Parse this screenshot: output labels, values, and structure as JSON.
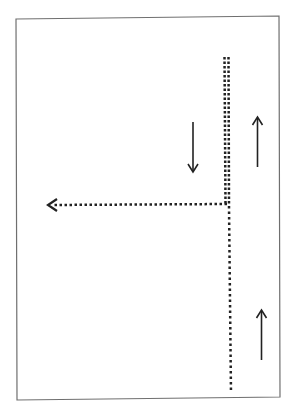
{
  "diagram": {
    "title": "",
    "colors": {
      "line": "#222222",
      "border": "#6f6f6f",
      "background": "#ffffff"
    },
    "elements": [
      {
        "id": "double-dotted-line",
        "style": "double-dotted"
      },
      {
        "id": "single-dotted-line",
        "style": "dotted"
      },
      {
        "id": "left-turn-dotted-arrow",
        "style": "dotted",
        "direction": "left"
      },
      {
        "id": "arrow-down",
        "direction": "down"
      },
      {
        "id": "arrow-up-top",
        "direction": "up"
      },
      {
        "id": "arrow-up-bottom",
        "direction": "up"
      }
    ]
  }
}
